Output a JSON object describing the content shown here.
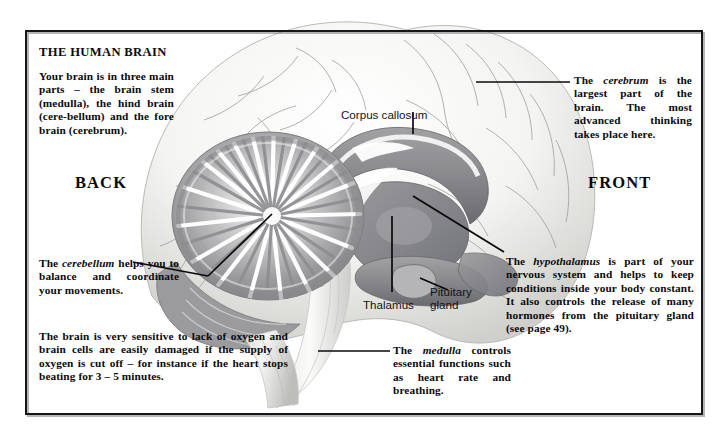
{
  "figure": {
    "title": "THE HUMAN BRAIN",
    "orientation": {
      "back": "BACK",
      "front": "FRONT"
    },
    "intro_text": "Your brain is in three main parts – the brain stem (medulla), the hind brain (cere-bellum) and the fore brain (cerebrum).",
    "callouts": [
      {
        "name": "cerebrum",
        "pre": "The ",
        "emphasis": "cerebrum",
        "post": " is the largest part of the brain. The most advanced thinking takes place here."
      },
      {
        "name": "cerebellum",
        "pre": "The ",
        "emphasis": "cerebellum",
        "post": " helps you to balance and coordinate your movements."
      },
      {
        "name": "hypothalamus",
        "pre": "The ",
        "emphasis": "hypothalamus",
        "post": " is part of your nervous system and helps to keep conditions inside your body constant. It also controls the release of many hormones from the pituitary gland (see page 49)."
      },
      {
        "name": "medulla",
        "pre": "The ",
        "emphasis": "medulla",
        "post": " controls essential functions such as heart rate and breathing."
      },
      {
        "name": "oxygen-note",
        "pre": "",
        "emphasis": "",
        "post": "The brain is very sensitive to lack of oxygen and brain cells are easily damaged if the supply of oxygen is cut off – for instance if the heart stops beating for 3 – 5 minutes."
      }
    ],
    "anatomy_labels": [
      {
        "id": "corpus-callosum",
        "label": "Corpus callosum"
      },
      {
        "id": "thalamus",
        "label": "Thalamus"
      },
      {
        "id": "pituitary-gland",
        "label": "Pituitary\ngland"
      }
    ],
    "colors": {
      "frame": "#15161a",
      "ink": "#0a0a0c",
      "page": "#ffffff",
      "cortex_light": "#f2f2f0",
      "cortex_shade": "#d9d9d6",
      "deep_grey": "#8c8c8f",
      "deep_dark": "#6f7073",
      "cerebellum": "#9b9b9e",
      "white_matter": "#ffffff"
    }
  }
}
